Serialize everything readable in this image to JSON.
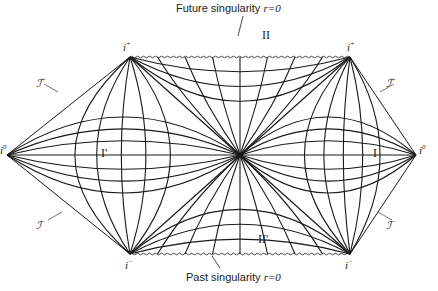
{
  "diagram": {
    "labels": {
      "future_singularity": "Future singularity r=0",
      "future_singularity_text": "Future singularity ",
      "future_singularity_eq": "r=0",
      "past_singularity_text": "Past singularity ",
      "past_singularity_eq": "r=0",
      "region_I": "I",
      "region_I_prime": "I'",
      "region_II": "II",
      "region_II_prime": "II'",
      "i_plus": "i",
      "i_plus_sup": "+",
      "i_minus": "i",
      "i_minus_sup": "−",
      "i_zero": "i",
      "i_zero_sup": "0",
      "scri_plus": "ȷ",
      "scri_symbol": "ℐ",
      "scri_plus_sup": "+",
      "scri_minus_sup": "−"
    },
    "vertices": {
      "i0_left": [
        7,
        155
      ],
      "i0_right": [
        416,
        155
      ],
      "iplus_left": [
        130,
        57
      ],
      "iplus_right": [
        350,
        57
      ],
      "iminus_left": [
        130,
        254
      ],
      "iminus_right": [
        350,
        254
      ],
      "center": [
        240,
        155
      ]
    },
    "colors": {
      "line": "#1a1a1a",
      "background": "#ffffff"
    }
  }
}
